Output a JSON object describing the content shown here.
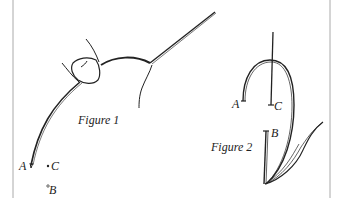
{
  "figure1": {
    "caption": "Figure 1",
    "labels": {
      "a": "A",
      "b": "B",
      "c": "C"
    }
  },
  "figure2": {
    "caption": "Figure 2",
    "labels": {
      "a": "A",
      "b": "B",
      "c": "C"
    }
  },
  "colors": {
    "ink": "#222222",
    "border": "#aaaaaa",
    "background": "#ffffff"
  }
}
